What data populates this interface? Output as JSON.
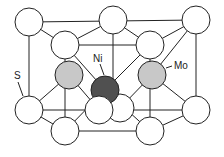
{
  "diagram": {
    "labels": {
      "s": "S",
      "ni": "Ni",
      "mo": "Mo"
    },
    "colors": {
      "s": "#ffffff",
      "mo": "#c8c8c8",
      "ni": "#505050",
      "line": "#222222"
    }
  }
}
